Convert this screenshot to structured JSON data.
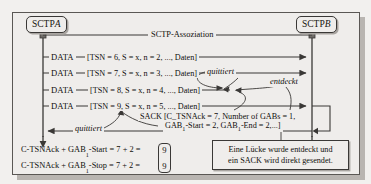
{
  "figure": {
    "background": "#efedeb",
    "line_color": "#3a3836"
  },
  "endpoints": {
    "left": {
      "name": "SCTP",
      "id": "A"
    },
    "right": {
      "name": "SCTP",
      "id": "B"
    }
  },
  "association": {
    "label": "SCTP-Assoziation"
  },
  "messages": [
    {
      "type": "DATA",
      "label": "DATA",
      "params": "[TSN = 6, S = x, n = 2, ..., Daten]",
      "direction": "a-to-b"
    },
    {
      "type": "DATA",
      "label": "DATA",
      "params": "[TSN = 7, S = x, n = 3, ..., Daten]",
      "direction": "a-to-b"
    },
    {
      "type": "DATA",
      "label": "DATA",
      "params": "[TSN = 8, S = x, n = 4, ..., Daten]",
      "direction": "a-to-b-lost"
    },
    {
      "type": "DATA",
      "label": "DATA",
      "params": "[TSN = 9, S = x, n = 5, ..., Daten]",
      "direction": "a-to-b"
    }
  ],
  "sack": {
    "line1": "SACK [C_TSNAck = 7, Number of GABs = 1,",
    "line2_prefix": "GAB",
    "line2_sub": "1",
    "line2": "-Start = 2, GAB",
    "line2_sub2": "1",
    "line2_suffix": "-End = 2,...]",
    "line2_full": "GAB1-Start = 2, GAB1-End = 2,...]",
    "direction": "b-to-a"
  },
  "annotations": {
    "quittiert_top": "quittiert",
    "entdeckt": "entdeckt",
    "quittiert_bottom": "quittiert"
  },
  "note": {
    "line1": "Eine Lücke wurde entdeckt und",
    "line2": "ein SACK wird direkt gesendet."
  },
  "calculations": [
    {
      "prefix": "C-TSNAck + GAB",
      "sub": "1",
      "suffix": "-Start = 7 + 2 =",
      "result": "9"
    },
    {
      "prefix": "C-TSNAck + GAB",
      "sub": "1",
      "suffix": "-Stop = 7 + 2 =",
      "result": "9"
    }
  ]
}
